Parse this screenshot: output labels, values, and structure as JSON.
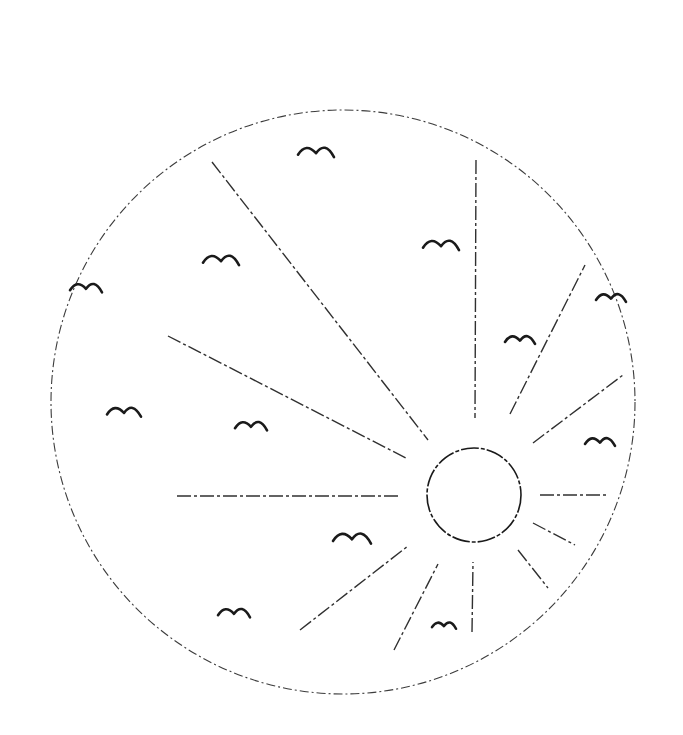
{
  "drawing": {
    "colors": {
      "ink": "#1a1a1a",
      "background": "#ffffff"
    },
    "outer_circle": {
      "cx": 343,
      "cy": 402,
      "r": 292
    },
    "sun": {
      "cx": 474,
      "cy": 495,
      "r": 47
    },
    "rays": [
      {
        "x1": 476,
        "y1": 160,
        "x2": 475,
        "y2": 418
      },
      {
        "x1": 212,
        "y1": 162,
        "x2": 428,
        "y2": 440
      },
      {
        "x1": 168,
        "y1": 336,
        "x2": 408,
        "y2": 459
      },
      {
        "x1": 177,
        "y1": 496,
        "x2": 398,
        "y2": 496
      },
      {
        "x1": 300,
        "y1": 630,
        "x2": 408,
        "y2": 546
      },
      {
        "x1": 394,
        "y1": 650,
        "x2": 438,
        "y2": 564
      },
      {
        "x1": 472,
        "y1": 632,
        "x2": 473,
        "y2": 562
      },
      {
        "x1": 518,
        "y1": 550,
        "x2": 548,
        "y2": 588
      },
      {
        "x1": 533,
        "y1": 523,
        "x2": 575,
        "y2": 545
      },
      {
        "x1": 540,
        "y1": 495,
        "x2": 608,
        "y2": 495
      },
      {
        "x1": 533,
        "y1": 443,
        "x2": 623,
        "y2": 375
      },
      {
        "x1": 510,
        "y1": 414,
        "x2": 585,
        "y2": 265
      }
    ],
    "birds": [
      {
        "x": 298,
        "y": 150,
        "w": 36
      },
      {
        "x": 203,
        "y": 258,
        "w": 36
      },
      {
        "x": 70,
        "y": 286,
        "w": 32
      },
      {
        "x": 423,
        "y": 243,
        "w": 36
      },
      {
        "x": 505,
        "y": 338,
        "w": 30
      },
      {
        "x": 596,
        "y": 296,
        "w": 30
      },
      {
        "x": 107,
        "y": 410,
        "w": 34
      },
      {
        "x": 235,
        "y": 424,
        "w": 32
      },
      {
        "x": 585,
        "y": 440,
        "w": 30
      },
      {
        "x": 333,
        "y": 536,
        "w": 38
      },
      {
        "x": 218,
        "y": 611,
        "w": 32
      },
      {
        "x": 432,
        "y": 624,
        "w": 24
      }
    ]
  }
}
